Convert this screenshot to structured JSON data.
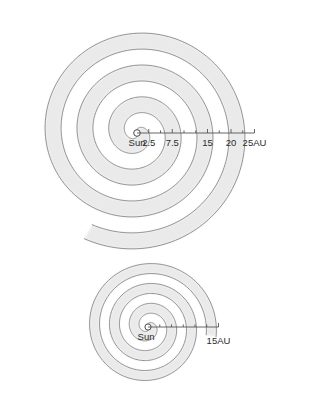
{
  "figure": {
    "type": "spiral-diagram",
    "background_color": "#ffffff",
    "line_color": "#6b6b6b",
    "band_color": "#e8e8e8",
    "axis_color": "#555555",
    "text_color": "#2b2b2b"
  },
  "chart_data": {
    "type": "scatter",
    "title": "",
    "subtitle": "",
    "xlabel": "",
    "ylabel": "",
    "panels": [
      {
        "name": "top-panel",
        "description": "Archimedean spiral of solar wind / heliospheric current sheet with shaded sectors, large pitch",
        "center": {
          "x": 137,
          "y": 133
        },
        "scale_px_per_au": 4.7,
        "turns": 3.6,
        "max_radius_au": 24.5,
        "ruler": {
          "origin_au": 0,
          "end_au": 25,
          "minor_tick_step_au": 2.5,
          "labels": [
            "2.5",
            "7.5",
            "15",
            "20",
            "25AU"
          ],
          "label_values_au": [
            2.5,
            7.5,
            15,
            20,
            25
          ],
          "unit": "AU"
        },
        "sun_label": "Sun"
      },
      {
        "name": "bottom-panel",
        "description": "Archimedean spiral with tighter winding, shaded sectors, small pitch",
        "center": {
          "x": 148,
          "y": 327
        },
        "scale_px_per_au": 4.7,
        "turns": 3.3,
        "max_radius_au": 14.0,
        "ruler": {
          "origin_au": 0,
          "end_au": 15,
          "minor_tick_step_au": 2.5,
          "labels": [
            "15AU"
          ],
          "label_values_au": [
            15
          ],
          "unit": "AU"
        },
        "sun_label": "Sun"
      }
    ]
  },
  "top_panel": {
    "sun_label": "Sun",
    "ticks": [
      {
        "value": 2.5,
        "label": "2.5"
      },
      {
        "value": 7.5,
        "label": "7.5"
      },
      {
        "value": 15,
        "label": "15"
      },
      {
        "value": 20,
        "label": "20"
      },
      {
        "value": 25,
        "label": "25AU"
      }
    ]
  },
  "bottom_panel": {
    "sun_label": "Sun",
    "ticks": [
      {
        "value": 15,
        "label": "15AU"
      }
    ]
  }
}
